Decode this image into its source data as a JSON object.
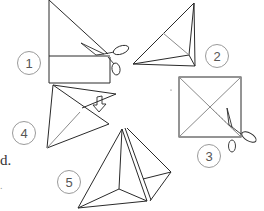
{
  "diagram": {
    "line_color": "#2a2a2a",
    "light_line_color": "#8a8a8a",
    "badge_color": "#9a9a9a",
    "steps": [
      {
        "number": "1",
        "label": "1",
        "description": "Fold corner down to make triangle and cut off the strip"
      },
      {
        "number": "2",
        "label": "2",
        "description": "Folded triangle with crease"
      },
      {
        "number": "3",
        "label": "3",
        "description": "Unfolded square with diagonal creases; cut along one diagonal to center"
      },
      {
        "number": "4",
        "label": "4",
        "description": "Overlap cut flaps (arrow)"
      },
      {
        "number": "5",
        "label": "5",
        "description": "Finished pyramid"
      }
    ],
    "cut_off_text": {
      "fragment_1": "d.",
      "fragment_2": "."
    }
  }
}
